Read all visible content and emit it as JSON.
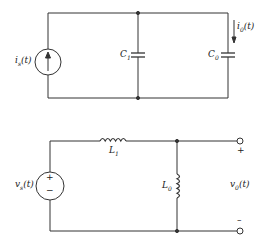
{
  "diagram": {
    "type": "circuit-schematic",
    "circuit_top": {
      "name": "capacitive network",
      "source": {
        "kind": "current-source",
        "label_main": "i",
        "label_sub": "s",
        "label_arg": "(t)",
        "direction": "up"
      },
      "components": [
        {
          "id": "C1",
          "kind": "capacitor",
          "label_main": "C",
          "label_sub": "1"
        },
        {
          "id": "C0",
          "kind": "capacitor",
          "label_main": "C",
          "label_sub": "0"
        }
      ],
      "current_label": {
        "label_main": "i",
        "label_sub": "0",
        "label_arg": "(t)",
        "direction": "down"
      }
    },
    "circuit_bottom": {
      "name": "inductive network",
      "source": {
        "kind": "voltage-source",
        "label_main": "v",
        "label_sub": "s",
        "label_arg": "(t)",
        "plus": "+",
        "minus": "−"
      },
      "components": [
        {
          "id": "L1",
          "kind": "inductor",
          "label_main": "L",
          "label_sub": "1"
        },
        {
          "id": "L0",
          "kind": "inductor",
          "label_main": "L",
          "label_sub": "0"
        }
      ],
      "output": {
        "label_main": "v",
        "label_sub": "0",
        "label_arg": "(t)",
        "plus": "+",
        "minus": "–"
      }
    },
    "colors": {
      "line": "#333333",
      "background": "#ffffff"
    }
  }
}
